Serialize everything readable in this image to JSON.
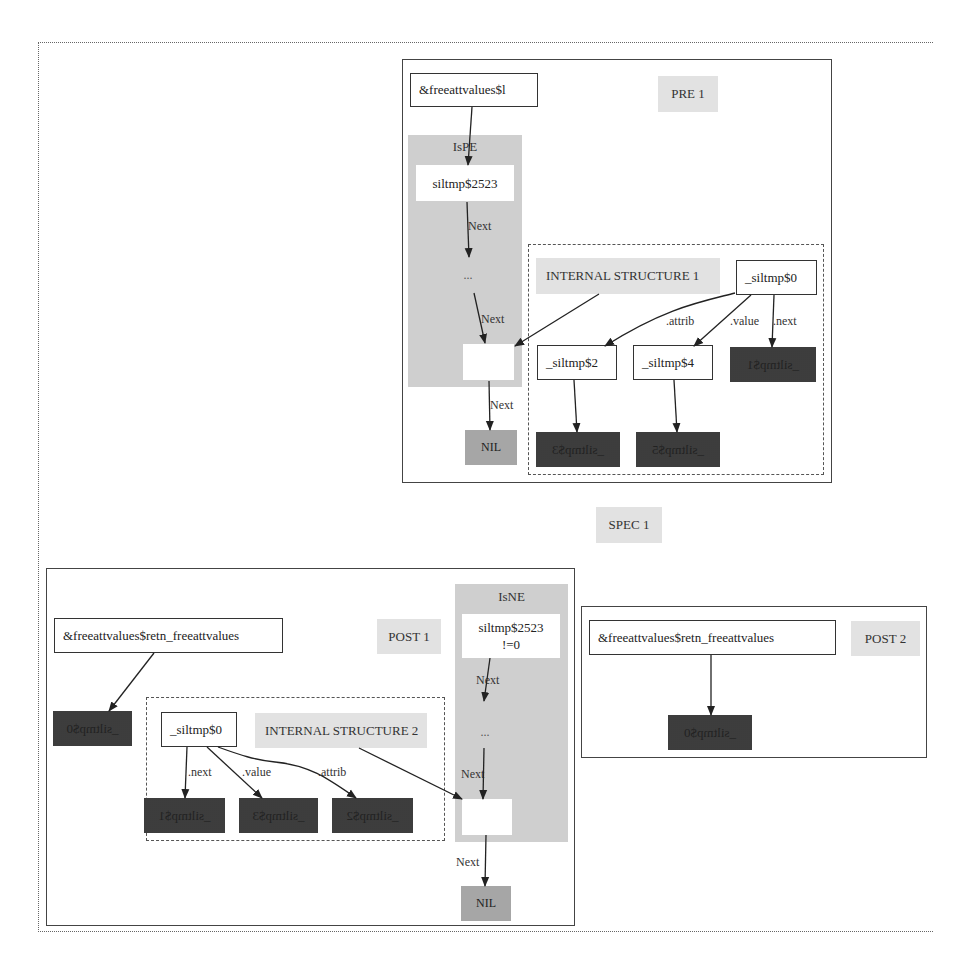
{
  "spec": {
    "label": "SPEC 1"
  },
  "pre1": {
    "label": "PRE 1",
    "root_node": "&freeattvalues$l",
    "ispe_cluster": {
      "title": "IsPE",
      "head_node": "siltmp$2523",
      "ellipsis": "...",
      "edge_labels": [
        "Next",
        "Next",
        "Next"
      ],
      "nil_node": "NIL"
    },
    "internal_structure": {
      "label": "INTERNAL STRUCTURE 1",
      "root": "_siltmp$0",
      "edges": [
        ".attrib",
        ".value",
        ".next"
      ],
      "children": [
        "_siltmp$2",
        "_siltmp$4",
        "_siltmp$1"
      ],
      "grandchildren": [
        "_siltmp$3",
        "_siltmp$5"
      ]
    }
  },
  "post1": {
    "label": "POST 1",
    "root_node": "&freeattvalues$retn_freeattvalues",
    "target_dark": "_siltmp$0",
    "isne_cluster": {
      "title": "IsNE",
      "head_node_line1": "siltmp$2523",
      "head_node_line2": "!=0",
      "ellipsis": "...",
      "edge_labels": [
        "Next",
        "Next",
        "Next"
      ],
      "nil_node": "NIL"
    },
    "internal_structure": {
      "label": "INTERNAL STRUCTURE 2",
      "root": "_siltmp$0",
      "edges": [
        ".next",
        ".value",
        ".attrib"
      ],
      "children": [
        "_siltmp$1",
        "_siltmp$3",
        "_siltmp$2"
      ]
    }
  },
  "post2": {
    "label": "POST 2",
    "root_node": "&freeattvalues$retn_freeattvalues",
    "target_dark": "_siltmp$0"
  },
  "colors": {
    "dark_node": "#555555",
    "nil_node": "#a6a6a6",
    "cluster_fill": "#cfcfcf",
    "label_fill": "#e2e2e2",
    "border": "#444444"
  }
}
